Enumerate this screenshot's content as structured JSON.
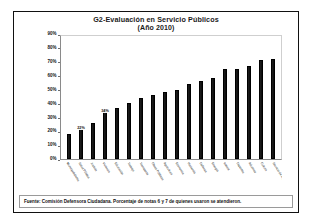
{
  "figure": {
    "title_line1": "G2-Evaluación en Servicio Públicos",
    "title_line2": "(Año 2010)",
    "source_note": "Fuente: Comisión Defensora Ciudadana. Porcentaje de notas 6 y 7 de quienes usaron se atendieron.",
    "frame_color": "#111111",
    "bar_color": "#1b1b1b",
    "background": "#ffffff"
  },
  "chart_data": {
    "type": "bar",
    "title": "G2-Evaluación en Servicio Públicos (Año 2010)",
    "xlabel": "",
    "ylabel": "",
    "ylim": [
      0,
      90
    ],
    "ytick_labels": [
      "90%",
      "80%",
      "70%",
      "60%",
      "50%",
      "40%",
      "30%",
      "20%",
      "10%",
      "0%"
    ],
    "ytick_values": [
      90,
      80,
      70,
      60,
      50,
      40,
      30,
      20,
      10,
      0
    ],
    "grid": false,
    "legend": null,
    "categories": [
      "Municipalidades",
      "Salud Pública",
      "Justicia",
      "Vivienda",
      "Educación",
      "Trabajo",
      "Transporte",
      "Obras Públicas",
      "Agricultura",
      "Economía",
      "Hacienda",
      "Defensa",
      "Energía",
      "Interior",
      "Deportes",
      "Aduanas",
      "Cultura",
      "Servicio de Impuestos Internos"
    ],
    "values": [
      18,
      22,
      26,
      34,
      37,
      40,
      44,
      46,
      48,
      50,
      54,
      56,
      58,
      65,
      65,
      67,
      71,
      72
    ],
    "data_labels": [
      {
        "index": 1,
        "text": "22%"
      },
      {
        "index": 3,
        "text": "34%"
      }
    ]
  }
}
